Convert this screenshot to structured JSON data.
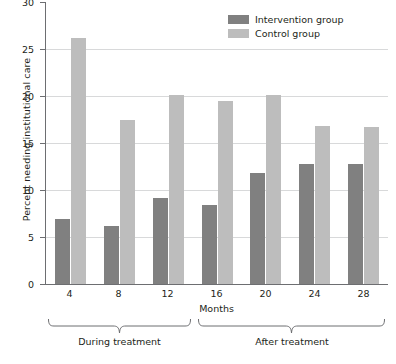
{
  "chart_data": {
    "type": "bar",
    "title": "",
    "xlabel": "Months",
    "ylabel": "Percent needing institutional care",
    "categories": [
      "4",
      "8",
      "12",
      "16",
      "20",
      "24",
      "28"
    ],
    "series": [
      {
        "name": "Intervention group",
        "color": "#808080",
        "values": [
          6.9,
          6.2,
          9.1,
          8.4,
          11.8,
          12.7,
          12.7
        ]
      },
      {
        "name": "Control group",
        "color": "#bdbdbd",
        "values": [
          26.1,
          17.4,
          20.0,
          19.4,
          20.0,
          16.7,
          16.6
        ]
      }
    ],
    "ylim": [
      0,
      30
    ],
    "yticks": [
      "0",
      "5",
      "10",
      "15",
      "20",
      "25",
      "30"
    ],
    "grid": true,
    "legend_position": "top-right",
    "annotations": [
      {
        "label": "During treatment",
        "covers": [
          "4",
          "8",
          "12"
        ]
      },
      {
        "label": "After treatment",
        "covers": [
          "16",
          "20",
          "24",
          "28"
        ]
      }
    ]
  },
  "axes": {
    "y_title": "Percent needing institutional care",
    "x_title": "Months",
    "y_ticks": [
      "30",
      "25",
      "20",
      "15",
      "10",
      "5",
      "0"
    ],
    "x_ticks": [
      "4",
      "8",
      "12",
      "16",
      "20",
      "24",
      "28"
    ]
  },
  "legend": {
    "items": [
      {
        "label": "Intervention group",
        "color": "#808080"
      },
      {
        "label": "Control group",
        "color": "#bdbdbd"
      }
    ]
  },
  "brackets": [
    {
      "label": "During treatment"
    },
    {
      "label": "After treatment"
    }
  ],
  "colors": {
    "intervention": "#808080",
    "control": "#bdbdbd",
    "axis": "#6d6e71",
    "grid": "#d8d9da",
    "text": "#231f20"
  }
}
